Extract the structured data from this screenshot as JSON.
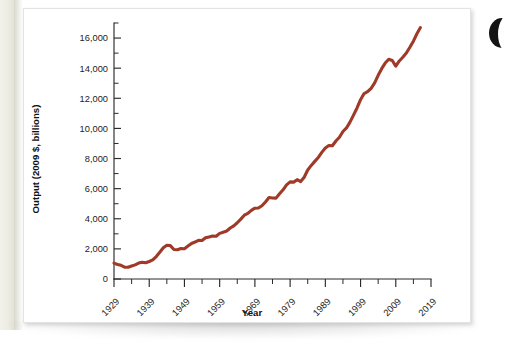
{
  "figure": {
    "background_color": "#ffffff",
    "page_edge_color": "#eeede3",
    "accent_color": "#a03a28"
  },
  "chart_data": {
    "type": "line",
    "title": "",
    "xlabel": "Year",
    "ylabel": "Output (2009 $, billions)",
    "xlim": [
      1929,
      2019
    ],
    "ylim": [
      0,
      17000
    ],
    "grid": false,
    "legend": null,
    "line_color": "#a03a28",
    "x_major_ticks": [
      1929,
      1939,
      1949,
      1959,
      1969,
      1979,
      1989,
      1999,
      2009,
      2019
    ],
    "x_tick_labels": [
      "1929",
      "1939",
      "1949",
      "1959",
      "1969",
      "1979",
      "1989",
      "1999",
      "2009",
      "2019"
    ],
    "x_minor_tick_interval": 5,
    "y_major_ticks": [
      0,
      2000,
      4000,
      6000,
      8000,
      10000,
      12000,
      14000,
      16000
    ],
    "y_tick_labels": [
      "0",
      "2,000",
      "4,000",
      "6,000",
      "8,000",
      "10,000",
      "12,000",
      "14,000",
      "16,000"
    ],
    "y_minor_tick_interval": 1000,
    "series": [
      {
        "name": "Real GDP",
        "x": [
          1929,
          1930,
          1931,
          1932,
          1933,
          1934,
          1935,
          1936,
          1937,
          1938,
          1939,
          1940,
          1941,
          1942,
          1943,
          1944,
          1945,
          1946,
          1947,
          1948,
          1949,
          1950,
          1951,
          1952,
          1953,
          1954,
          1955,
          1956,
          1957,
          1958,
          1959,
          1960,
          1961,
          1962,
          1963,
          1964,
          1965,
          1966,
          1967,
          1968,
          1969,
          1970,
          1971,
          1972,
          1973,
          1974,
          1975,
          1976,
          1977,
          1978,
          1979,
          1980,
          1981,
          1982,
          1983,
          1984,
          1985,
          1986,
          1987,
          1988,
          1989,
          1990,
          1991,
          1992,
          1993,
          1994,
          1995,
          1996,
          1997,
          1998,
          1999,
          2000,
          2001,
          2002,
          2003,
          2004,
          2005,
          2006,
          2007,
          2008,
          2009,
          2010,
          2011,
          2012,
          2013,
          2014,
          2015,
          2016
        ],
        "values": [
          1057,
          967,
          905,
          788,
          777,
          862,
          939,
          1060,
          1114,
          1077,
          1163,
          1266,
          1490,
          1772,
          2074,
          2240,
          2218,
          1963,
          1940,
          2020,
          2009,
          2184,
          2360,
          2456,
          2571,
          2556,
          2739,
          2797,
          2856,
          2835,
          3031,
          3108,
          3189,
          3383,
          3530,
          3734,
          3976,
          4238,
          4356,
          4560,
          4703,
          4710,
          4863,
          5117,
          5411,
          5383,
          5372,
          5663,
          5923,
          6253,
          6451,
          6434,
          6596,
          6469,
          6760,
          7240,
          7543,
          7812,
          8072,
          8409,
          8704,
          8867,
          8849,
          9161,
          9411,
          9797,
          10032,
          10418,
          10884,
          11358,
          11907,
          12317,
          12438,
          12662,
          13019,
          13528,
          13968,
          14340,
          14595,
          14511,
          14133,
          14480,
          14724,
          15006,
          15386,
          15794,
          16284,
          16700
        ]
      }
    ],
    "annotations": []
  }
}
